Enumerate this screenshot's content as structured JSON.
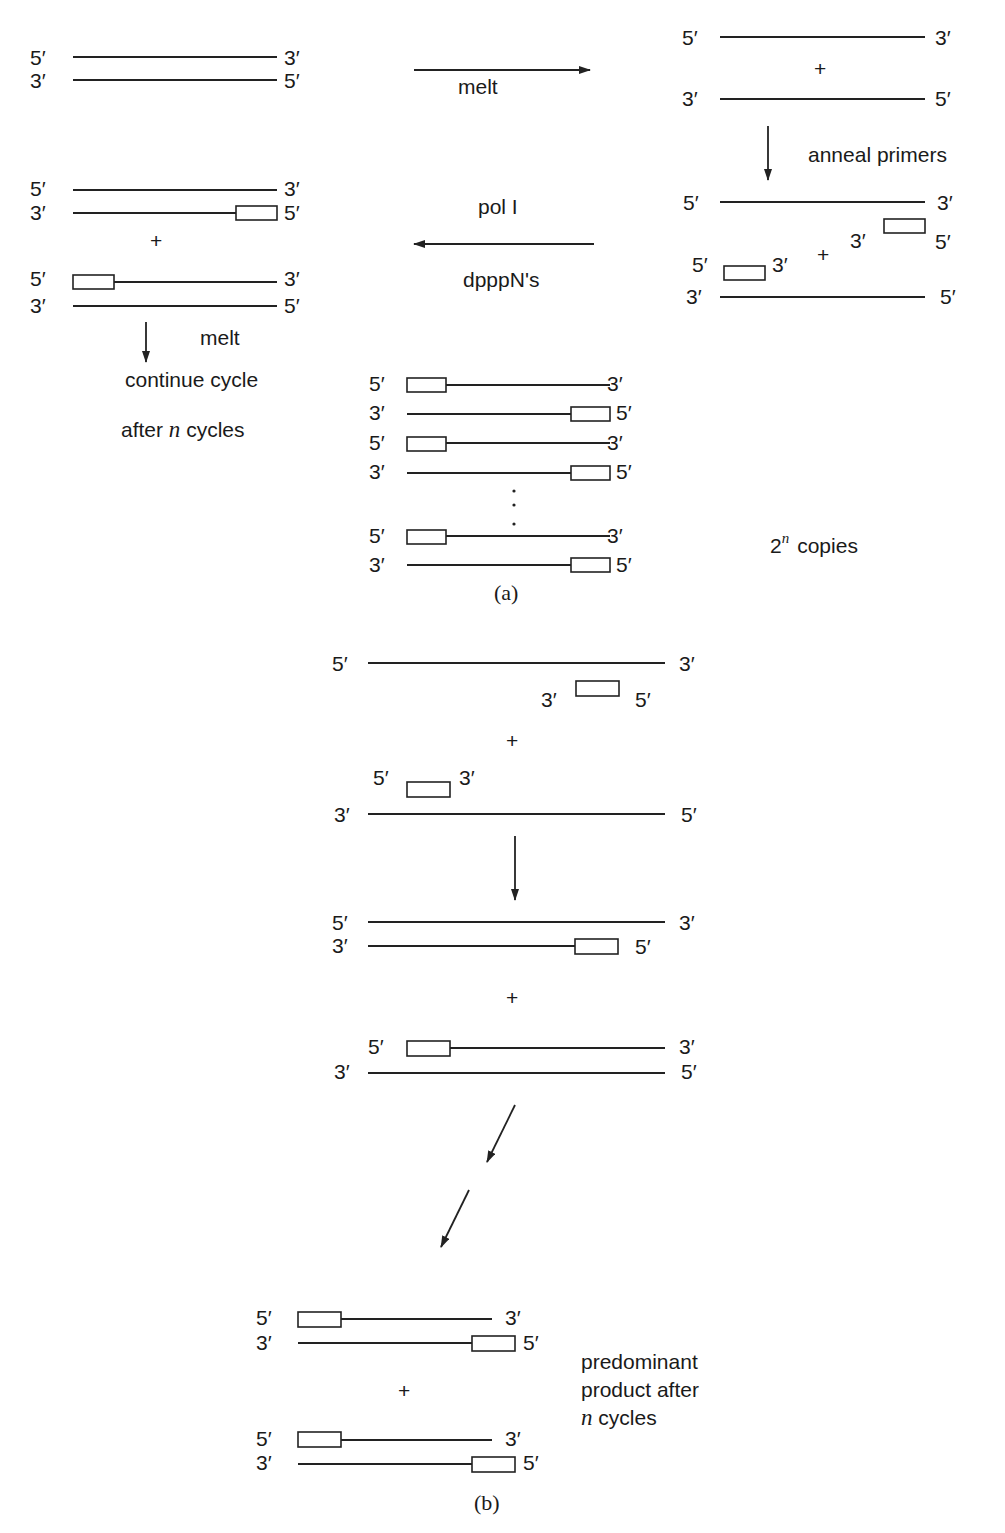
{
  "labels": {
    "five_prime": "5′",
    "three_prime": "3′",
    "plus": "+",
    "ellipsis_dot": "·"
  },
  "panel_a": {
    "caption": "(a)",
    "steps": {
      "melt": "melt",
      "anneal_primers": "anneal primers",
      "pol": "pol I",
      "nucleotides": "dpppN's",
      "melt_again": "melt",
      "continue_cycle": "continue cycle",
      "after_n_cycles_prefix": "after ",
      "after_n_cycles_var": "n",
      "after_n_cycles_suffix": " cycles"
    },
    "copies_base": "2",
    "copies_exp": "n",
    "copies_label": "copies"
  },
  "panel_b": {
    "caption": "(b)",
    "product_line1": "predominant",
    "product_line2": "product after",
    "product_line3_var": "n",
    "product_line3_suffix": " cycles"
  }
}
